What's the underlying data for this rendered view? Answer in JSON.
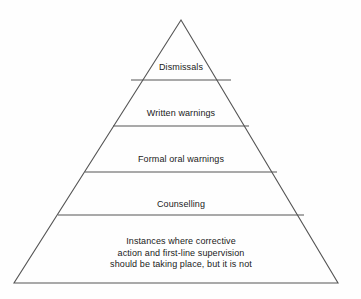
{
  "diagram": {
    "type": "pyramid",
    "background_color": "#fefefe",
    "stroke_color": "#555555",
    "text_color": "#1a1a1a",
    "apex": {
      "x": 181,
      "y": 20
    },
    "base_left": {
      "x": 14,
      "y": 283
    },
    "base_right": {
      "x": 338,
      "y": 283
    },
    "tiers": [
      {
        "id": "dismissals",
        "label": "Dismissals",
        "divider_y": 80,
        "divider_x1": 131,
        "divider_x2": 231,
        "lines": [
          "Dismissals"
        ]
      },
      {
        "id": "written-warnings",
        "label": "Written warnings",
        "divider_y": 126,
        "divider_x1": 113,
        "divider_x2": 249,
        "lines": [
          "Written warnings"
        ]
      },
      {
        "id": "formal-oral-warnings",
        "label": "Formal oral warnings",
        "divider_y": 172,
        "divider_x1": 85,
        "divider_x2": 277,
        "lines": [
          "Formal oral warnings"
        ]
      },
      {
        "id": "counselling",
        "label": "Counselling",
        "divider_y": 215,
        "divider_x1": 58,
        "divider_x2": 304,
        "lines": [
          "Counselling"
        ]
      },
      {
        "id": "base-instances",
        "label": "Instances where corrective action and first-line supervision should be taking place, but it is not",
        "divider_y": null,
        "lines": [
          "Instances where corrective",
          "action and first-line supervision",
          "should be taking place, but it is not"
        ]
      }
    ]
  }
}
